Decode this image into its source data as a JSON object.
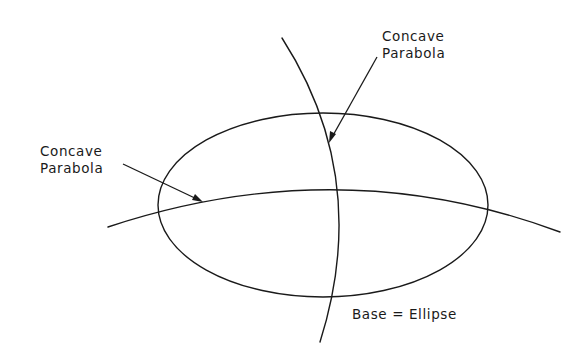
{
  "diagram": {
    "labels": {
      "top_parabola": {
        "line1": "Concave",
        "line2": "Parabola"
      },
      "left_parabola": {
        "line1": "Concave",
        "line2": "Parabola"
      },
      "base": "Base = Ellipse"
    },
    "shapes": {
      "base_ellipse": {
        "cx": 323,
        "cy": 205,
        "rx": 165,
        "ry": 92
      },
      "horizontal_parabola": "concave, spanning left to right across the ellipse",
      "vertical_parabola": "concave, spanning top to bottom across the ellipse"
    },
    "colors": {
      "stroke": "#1a1a1a",
      "background": "#ffffff"
    }
  }
}
